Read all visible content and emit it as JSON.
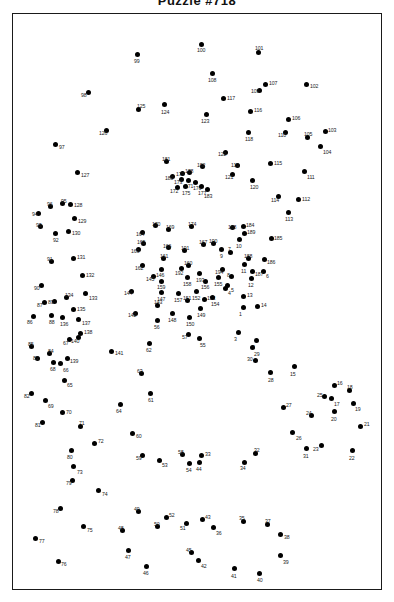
{
  "header": {
    "title": "Puzzle #718",
    "title_clipped": true
  },
  "frame": {
    "border_color": "#1a1a1a",
    "background": "#ffffff"
  },
  "style": {
    "dot_color": "#000000",
    "label_color": "#1a1a1a",
    "dot_radius_px": 2.5
  },
  "puzzle": {
    "type": "connect-the-dots",
    "dot_count": 194,
    "number_range": [
      1,
      194
    ]
  },
  "dots": [
    {
      "n": "1",
      "x": 243,
      "y": 307,
      "lx": 239,
      "ly": 312
    },
    {
      "n": "2",
      "x": 256,
      "y": 340,
      "lx": 252,
      "ly": 345
    },
    {
      "n": "3",
      "x": 238,
      "y": 332,
      "lx": 234,
      "ly": 337
    },
    {
      "n": "4",
      "x": 225,
      "y": 288,
      "lx": 228,
      "ly": 291
    },
    {
      "n": "5",
      "x": 227,
      "y": 285,
      "lx": 231,
      "ly": 288
    },
    {
      "n": "6",
      "x": 263,
      "y": 271,
      "lx": 266,
      "ly": 274
    },
    {
      "n": "7",
      "x": 230,
      "y": 252,
      "lx": 228,
      "ly": 247
    },
    {
      "n": "8",
      "x": 231,
      "y": 276,
      "lx": 227,
      "ly": 273
    },
    {
      "n": "9",
      "x": 221,
      "y": 249,
      "lx": 220,
      "ly": 254
    },
    {
      "n": "10",
      "x": 239,
      "y": 239,
      "lx": 236,
      "ly": 244
    },
    {
      "n": "11",
      "x": 244,
      "y": 264,
      "lx": 241,
      "ly": 269
    },
    {
      "n": "12",
      "x": 251,
      "y": 278,
      "lx": 248,
      "ly": 283
    },
    {
      "n": "13",
      "x": 243,
      "y": 296,
      "lx": 247,
      "ly": 293
    },
    {
      "n": "14",
      "x": 257,
      "y": 306,
      "lx": 261,
      "ly": 303
    },
    {
      "n": "15",
      "x": 294,
      "y": 366,
      "lx": 290,
      "ly": 372
    },
    {
      "n": "16",
      "x": 334,
      "y": 385,
      "lx": 337,
      "ly": 381
    },
    {
      "n": "17",
      "x": 331,
      "y": 398,
      "lx": 334,
      "ly": 402
    },
    {
      "n": "18",
      "x": 349,
      "y": 390,
      "lx": 347,
      "ly": 385
    },
    {
      "n": "19",
      "x": 353,
      "y": 403,
      "lx": 355,
      "ly": 407
    },
    {
      "n": "20",
      "x": 334,
      "y": 411,
      "lx": 331,
      "ly": 417
    },
    {
      "n": "21",
      "x": 360,
      "y": 426,
      "lx": 364,
      "ly": 422
    },
    {
      "n": "22",
      "x": 352,
      "y": 450,
      "lx": 349,
      "ly": 456
    },
    {
      "n": "23",
      "x": 321,
      "y": 445,
      "lx": 313,
      "ly": 447
    },
    {
      "n": "24",
      "x": 311,
      "y": 415,
      "lx": 306,
      "ly": 411
    },
    {
      "n": "25",
      "x": 324,
      "y": 396,
      "lx": 317,
      "ly": 393
    },
    {
      "n": "26",
      "x": 292,
      "y": 432,
      "lx": 296,
      "ly": 436
    },
    {
      "n": "27",
      "x": 283,
      "y": 407,
      "lx": 286,
      "ly": 403
    },
    {
      "n": "28",
      "x": 270,
      "y": 372,
      "lx": 268,
      "ly": 378
    },
    {
      "n": "29",
      "x": 252,
      "y": 347,
      "lx": 254,
      "ly": 352
    },
    {
      "n": "30",
      "x": 255,
      "y": 360,
      "lx": 247,
      "ly": 357
    },
    {
      "n": "31",
      "x": 306,
      "y": 448,
      "lx": 303,
      "ly": 454
    },
    {
      "n": "32",
      "x": 255,
      "y": 453,
      "lx": 254,
      "ly": 448
    },
    {
      "n": "33",
      "x": 201,
      "y": 455,
      "lx": 205,
      "ly": 452
    },
    {
      "n": "34",
      "x": 244,
      "y": 462,
      "lx": 240,
      "ly": 466
    },
    {
      "n": "35",
      "x": 243,
      "y": 521,
      "lx": 239,
      "ly": 516
    },
    {
      "n": "36",
      "x": 213,
      "y": 527,
      "lx": 216,
      "ly": 531
    },
    {
      "n": "37",
      "x": 267,
      "y": 524,
      "lx": 265,
      "ly": 519
    },
    {
      "n": "38",
      "x": 280,
      "y": 534,
      "lx": 284,
      "ly": 535
    },
    {
      "n": "39",
      "x": 280,
      "y": 555,
      "lx": 283,
      "ly": 560
    },
    {
      "n": "40",
      "x": 259,
      "y": 573,
      "lx": 257,
      "ly": 578
    },
    {
      "n": "41",
      "x": 234,
      "y": 568,
      "lx": 231,
      "ly": 574
    },
    {
      "n": "42",
      "x": 198,
      "y": 560,
      "lx": 201,
      "ly": 564
    },
    {
      "n": "43",
      "x": 202,
      "y": 519,
      "lx": 205,
      "ly": 515
    },
    {
      "n": "44",
      "x": 199,
      "y": 462,
      "lx": 196,
      "ly": 467
    },
    {
      "n": "45",
      "x": 191,
      "y": 552,
      "lx": 186,
      "ly": 548
    },
    {
      "n": "46",
      "x": 146,
      "y": 566,
      "lx": 143,
      "ly": 571
    },
    {
      "n": "47",
      "x": 128,
      "y": 550,
      "lx": 125,
      "ly": 555
    },
    {
      "n": "48",
      "x": 122,
      "y": 530,
      "lx": 118,
      "ly": 526
    },
    {
      "n": "49",
      "x": 138,
      "y": 511,
      "lx": 134,
      "ly": 507
    },
    {
      "n": "50",
      "x": 157,
      "y": 526,
      "lx": 154,
      "ly": 522
    },
    {
      "n": "51",
      "x": 186,
      "y": 523,
      "lx": 180,
      "ly": 526
    },
    {
      "n": "52",
      "x": 166,
      "y": 517,
      "lx": 169,
      "ly": 513
    },
    {
      "n": "53",
      "x": 159,
      "y": 460,
      "lx": 162,
      "ly": 463
    },
    {
      "n": "54",
      "x": 189,
      "y": 463,
      "lx": 186,
      "ly": 468
    },
    {
      "n": "55",
      "x": 199,
      "y": 338,
      "lx": 200,
      "ly": 343
    },
    {
      "n": "56",
      "x": 157,
      "y": 320,
      "lx": 154,
      "ly": 325
    },
    {
      "n": "57",
      "x": 188,
      "y": 334,
      "lx": 182,
      "ly": 335
    },
    {
      "n": "58",
      "x": 182,
      "y": 454,
      "lx": 178,
      "ly": 450
    },
    {
      "n": "59",
      "x": 142,
      "y": 455,
      "lx": 136,
      "ly": 456
    },
    {
      "n": "60",
      "x": 132,
      "y": 433,
      "lx": 136,
      "ly": 434
    },
    {
      "n": "61",
      "x": 150,
      "y": 393,
      "lx": 148,
      "ly": 398
    },
    {
      "n": "62",
      "x": 149,
      "y": 343,
      "lx": 146,
      "ly": 348
    },
    {
      "n": "63",
      "x": 141,
      "y": 373,
      "lx": 137,
      "ly": 369
    },
    {
      "n": "64",
      "x": 120,
      "y": 404,
      "lx": 116,
      "ly": 409
    },
    {
      "n": "65",
      "x": 64,
      "y": 380,
      "lx": 67,
      "ly": 383
    },
    {
      "n": "66",
      "x": 60,
      "y": 363,
      "lx": 63,
      "ly": 368
    },
    {
      "n": "67",
      "x": 69,
      "y": 339,
      "lx": 63,
      "ly": 341
    },
    {
      "n": "68",
      "x": 53,
      "y": 362,
      "lx": 50,
      "ly": 367
    },
    {
      "n": "69",
      "x": 45,
      "y": 400,
      "lx": 48,
      "ly": 404
    },
    {
      "n": "70",
      "x": 62,
      "y": 412,
      "lx": 66,
      "ly": 410
    },
    {
      "n": "71",
      "x": 80,
      "y": 426,
      "lx": 79,
      "ly": 421
    },
    {
      "n": "72",
      "x": 94,
      "y": 443,
      "lx": 98,
      "ly": 439
    },
    {
      "n": "73",
      "x": 73,
      "y": 466,
      "lx": 77,
      "ly": 470
    },
    {
      "n": "74",
      "x": 98,
      "y": 490,
      "lx": 102,
      "ly": 492
    },
    {
      "n": "75",
      "x": 83,
      "y": 526,
      "lx": 87,
      "ly": 528
    },
    {
      "n": "76",
      "x": 58,
      "y": 561,
      "lx": 61,
      "ly": 562
    },
    {
      "n": "77",
      "x": 35,
      "y": 538,
      "lx": 39,
      "ly": 539
    },
    {
      "n": "78",
      "x": 60,
      "y": 508,
      "lx": 53,
      "ly": 509
    },
    {
      "n": "79",
      "x": 72,
      "y": 480,
      "lx": 66,
      "ly": 481
    },
    {
      "n": "80",
      "x": 71,
      "y": 450,
      "lx": 67,
      "ly": 455
    },
    {
      "n": "81",
      "x": 42,
      "y": 422,
      "lx": 35,
      "ly": 423
    },
    {
      "n": "82",
      "x": 31,
      "y": 393,
      "lx": 24,
      "ly": 394
    },
    {
      "n": "83",
      "x": 37,
      "y": 358,
      "lx": 33,
      "ly": 356
    },
    {
      "n": "84",
      "x": 49,
      "y": 353,
      "lx": 48,
      "ly": 349
    },
    {
      "n": "85",
      "x": 31,
      "y": 346,
      "lx": 28,
      "ly": 342
    },
    {
      "n": "86",
      "x": 33,
      "y": 316,
      "lx": 27,
      "ly": 320
    },
    {
      "n": "87",
      "x": 44,
      "y": 302,
      "lx": 37,
      "ly": 303
    },
    {
      "n": "88",
      "x": 51,
      "y": 315,
      "lx": 49,
      "ly": 320
    },
    {
      "n": "89",
      "x": 54,
      "y": 301,
      "lx": 48,
      "ly": 300
    },
    {
      "n": "90",
      "x": 41,
      "y": 285,
      "lx": 34,
      "ly": 286
    },
    {
      "n": "91",
      "x": 51,
      "y": 261,
      "lx": 47,
      "ly": 257
    },
    {
      "n": "92",
      "x": 55,
      "y": 233,
      "lx": 53,
      "ly": 238
    },
    {
      "n": "93",
      "x": 40,
      "y": 226,
      "lx": 36,
      "ly": 223
    },
    {
      "n": "94",
      "x": 38,
      "y": 213,
      "lx": 32,
      "ly": 212
    },
    {
      "n": "95",
      "x": 62,
      "y": 203,
      "lx": 61,
      "ly": 199
    },
    {
      "n": "96",
      "x": 50,
      "y": 206,
      "lx": 47,
      "ly": 202
    },
    {
      "n": "97",
      "x": 55,
      "y": 144,
      "lx": 59,
      "ly": 145
    },
    {
      "n": "98",
      "x": 88,
      "y": 92,
      "lx": 81,
      "ly": 93
    },
    {
      "n": "99",
      "x": 137,
      "y": 54,
      "lx": 134,
      "ly": 59
    },
    {
      "n": "100",
      "x": 201,
      "y": 44,
      "lx": 197,
      "ly": 48
    },
    {
      "n": "101",
      "x": 258,
      "y": 52,
      "lx": 255,
      "ly": 46
    },
    {
      "n": "102",
      "x": 306,
      "y": 84,
      "lx": 310,
      "ly": 84
    },
    {
      "n": "103",
      "x": 325,
      "y": 131,
      "lx": 328,
      "ly": 128
    },
    {
      "n": "104",
      "x": 320,
      "y": 146,
      "lx": 323,
      "ly": 150
    },
    {
      "n": "105",
      "x": 307,
      "y": 137,
      "lx": 304,
      "ly": 132
    },
    {
      "n": "106",
      "x": 288,
      "y": 119,
      "lx": 292,
      "ly": 116
    },
    {
      "n": "107",
      "x": 265,
      "y": 84,
      "lx": 269,
      "ly": 81
    },
    {
      "n": "108",
      "x": 212,
      "y": 73,
      "lx": 208,
      "ly": 78
    },
    {
      "n": "109",
      "x": 259,
      "y": 90,
      "lx": 251,
      "ly": 89
    },
    {
      "n": "110",
      "x": 285,
      "y": 132,
      "lx": 278,
      "ly": 133
    },
    {
      "n": "111",
      "x": 304,
      "y": 171,
      "lx": 307,
      "ly": 175
    },
    {
      "n": "112",
      "x": 298,
      "y": 199,
      "lx": 302,
      "ly": 197
    },
    {
      "n": "113",
      "x": 288,
      "y": 212,
      "lx": 285,
      "ly": 217
    },
    {
      "n": "114",
      "x": 278,
      "y": 196,
      "lx": 271,
      "ly": 198
    },
    {
      "n": "115",
      "x": 270,
      "y": 163,
      "lx": 274,
      "ly": 161
    },
    {
      "n": "116",
      "x": 250,
      "y": 111,
      "lx": 254,
      "ly": 108
    },
    {
      "n": "117",
      "x": 223,
      "y": 98,
      "lx": 227,
      "ly": 96
    },
    {
      "n": "118",
      "x": 248,
      "y": 132,
      "lx": 245,
      "ly": 137
    },
    {
      "n": "119",
      "x": 237,
      "y": 165,
      "lx": 231,
      "ly": 163
    },
    {
      "n": "120",
      "x": 252,
      "y": 180,
      "lx": 250,
      "ly": 185
    },
    {
      "n": "121",
      "x": 232,
      "y": 174,
      "lx": 225,
      "ly": 175
    },
    {
      "n": "122",
      "x": 225,
      "y": 152,
      "lx": 218,
      "ly": 152
    },
    {
      "n": "123",
      "x": 206,
      "y": 114,
      "lx": 201,
      "ly": 119
    },
    {
      "n": "124",
      "x": 164,
      "y": 104,
      "lx": 161,
      "ly": 110
    },
    {
      "n": "125",
      "x": 138,
      "y": 109,
      "lx": 137,
      "ly": 104
    },
    {
      "n": "126",
      "x": 106,
      "y": 130,
      "lx": 99,
      "ly": 131
    },
    {
      "n": "127",
      "x": 77,
      "y": 172,
      "lx": 81,
      "ly": 173
    },
    {
      "n": "128",
      "x": 70,
      "y": 204,
      "lx": 74,
      "ly": 203
    },
    {
      "n": "129",
      "x": 74,
      "y": 218,
      "lx": 78,
      "ly": 219
    },
    {
      "n": "130",
      "x": 68,
      "y": 231,
      "lx": 72,
      "ly": 231
    },
    {
      "n": "131",
      "x": 73,
      "y": 258,
      "lx": 77,
      "ly": 255
    },
    {
      "n": "132",
      "x": 82,
      "y": 275,
      "lx": 86,
      "ly": 273
    },
    {
      "n": "133",
      "x": 85,
      "y": 293,
      "lx": 89,
      "ly": 296
    },
    {
      "n": "134",
      "x": 66,
      "y": 297,
      "lx": 65,
      "ly": 293
    },
    {
      "n": "135",
      "x": 73,
      "y": 309,
      "lx": 77,
      "ly": 307
    },
    {
      "n": "136",
      "x": 62,
      "y": 317,
      "lx": 60,
      "ly": 322
    },
    {
      "n": "137",
      "x": 78,
      "y": 319,
      "lx": 82,
      "ly": 321
    },
    {
      "n": "138",
      "x": 80,
      "y": 333,
      "lx": 84,
      "ly": 330
    },
    {
      "n": "139",
      "x": 67,
      "y": 358,
      "lx": 70,
      "ly": 359
    },
    {
      "n": "140",
      "x": 78,
      "y": 337,
      "lx": 71,
      "ly": 339
    },
    {
      "n": "141",
      "x": 111,
      "y": 351,
      "lx": 115,
      "ly": 351
    },
    {
      "n": "142",
      "x": 135,
      "y": 313,
      "lx": 128,
      "ly": 313
    },
    {
      "n": "143",
      "x": 157,
      "y": 305,
      "lx": 154,
      "ly": 300
    },
    {
      "n": "144",
      "x": 131,
      "y": 291,
      "lx": 124,
      "ly": 291
    },
    {
      "n": "145",
      "x": 153,
      "y": 276,
      "lx": 146,
      "ly": 277
    },
    {
      "n": "146",
      "x": 161,
      "y": 269,
      "lx": 156,
      "ly": 273
    },
    {
      "n": "147",
      "x": 161,
      "y": 292,
      "lx": 157,
      "ly": 297
    },
    {
      "n": "148",
      "x": 172,
      "y": 313,
      "lx": 168,
      "ly": 318
    },
    {
      "n": "149",
      "x": 200,
      "y": 308,
      "lx": 197,
      "ly": 313
    },
    {
      "n": "150",
      "x": 189,
      "y": 317,
      "lx": 186,
      "ly": 322
    },
    {
      "n": "151",
      "x": 187,
      "y": 300,
      "lx": 183,
      "ly": 296
    },
    {
      "n": "152",
      "x": 196,
      "y": 291,
      "lx": 192,
      "ly": 296
    },
    {
      "n": "153",
      "x": 204,
      "y": 299,
      "lx": 207,
      "ly": 296
    },
    {
      "n": "154",
      "x": 212,
      "y": 297,
      "lx": 211,
      "ly": 302
    },
    {
      "n": "155",
      "x": 218,
      "y": 277,
      "lx": 214,
      "ly": 282
    },
    {
      "n": "156",
      "x": 205,
      "y": 281,
      "lx": 201,
      "ly": 285
    },
    {
      "n": "157",
      "x": 178,
      "y": 293,
      "lx": 174,
      "ly": 298
    },
    {
      "n": "158",
      "x": 187,
      "y": 277,
      "lx": 183,
      "ly": 282
    },
    {
      "n": "159",
      "x": 161,
      "y": 281,
      "lx": 157,
      "ly": 285
    },
    {
      "n": "160",
      "x": 188,
      "y": 265,
      "lx": 184,
      "ly": 261
    },
    {
      "n": "161",
      "x": 163,
      "y": 258,
      "lx": 160,
      "ly": 254
    },
    {
      "n": "162",
      "x": 142,
      "y": 265,
      "lx": 135,
      "ly": 266
    },
    {
      "n": "163",
      "x": 138,
      "y": 249,
      "lx": 131,
      "ly": 249
    },
    {
      "n": "164",
      "x": 142,
      "y": 232,
      "lx": 136,
      "ly": 232
    },
    {
      "n": "165",
      "x": 143,
      "y": 243,
      "lx": 137,
      "ly": 240
    },
    {
      "n": "166",
      "x": 168,
      "y": 247,
      "lx": 163,
      "ly": 244
    },
    {
      "n": "167",
      "x": 203,
      "y": 244,
      "lx": 199,
      "ly": 240
    },
    {
      "n": "168",
      "x": 232,
      "y": 227,
      "lx": 228,
      "ly": 225
    },
    {
      "n": "169",
      "x": 168,
      "y": 229,
      "lx": 166,
      "ly": 225
    },
    {
      "n": "170",
      "x": 155,
      "y": 225,
      "lx": 152,
      "ly": 222
    },
    {
      "n": "171",
      "x": 188,
      "y": 180,
      "lx": 185,
      "ly": 184
    },
    {
      "n": "172",
      "x": 177,
      "y": 187,
      "lx": 170,
      "ly": 189
    },
    {
      "n": "173",
      "x": 181,
      "y": 179,
      "lx": 174,
      "ly": 180
    },
    {
      "n": "174",
      "x": 191,
      "y": 226,
      "lx": 188,
      "ly": 222
    },
    {
      "n": "175",
      "x": 185,
      "y": 186,
      "lx": 182,
      "ly": 191
    },
    {
      "n": "176",
      "x": 195,
      "y": 182,
      "lx": 193,
      "ly": 186
    },
    {
      "n": "177",
      "x": 201,
      "y": 186,
      "lx": 198,
      "ly": 191
    },
    {
      "n": "178",
      "x": 189,
      "y": 172,
      "lx": 185,
      "ly": 169
    },
    {
      "n": "179",
      "x": 182,
      "y": 173,
      "lx": 176,
      "ly": 172
    },
    {
      "n": "180",
      "x": 172,
      "y": 176,
      "lx": 165,
      "ly": 176
    },
    {
      "n": "181",
      "x": 166,
      "y": 161,
      "lx": 162,
      "ly": 157
    },
    {
      "n": "182",
      "x": 202,
      "y": 166,
      "lx": 197,
      "ly": 163
    },
    {
      "n": "183",
      "x": 207,
      "y": 189,
      "lx": 204,
      "ly": 194
    },
    {
      "n": "184",
      "x": 243,
      "y": 226,
      "lx": 246,
      "ly": 223
    },
    {
      "n": "185",
      "x": 271,
      "y": 238,
      "lx": 274,
      "ly": 236
    },
    {
      "n": "186",
      "x": 264,
      "y": 259,
      "lx": 267,
      "ly": 260
    },
    {
      "n": "187",
      "x": 252,
      "y": 271,
      "lx": 255,
      "ly": 272
    },
    {
      "n": "188",
      "x": 248,
      "y": 258,
      "lx": 244,
      "ly": 254
    },
    {
      "n": "189",
      "x": 244,
      "y": 233,
      "lx": 247,
      "ly": 230
    },
    {
      "n": "190",
      "x": 213,
      "y": 243,
      "lx": 209,
      "ly": 239
    },
    {
      "n": "191",
      "x": 184,
      "y": 250,
      "lx": 181,
      "ly": 246
    },
    {
      "n": "192",
      "x": 181,
      "y": 268,
      "lx": 175,
      "ly": 271
    },
    {
      "n": "193",
      "x": 199,
      "y": 273,
      "lx": 196,
      "ly": 278
    },
    {
      "n": "194",
      "x": 222,
      "y": 269,
      "lx": 215,
      "ly": 270
    }
  ]
}
